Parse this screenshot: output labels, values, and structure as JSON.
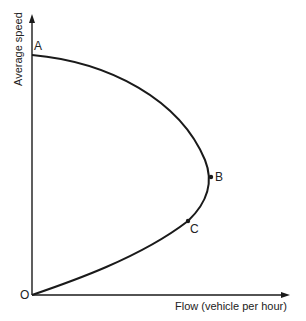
{
  "diagram": {
    "type": "speed-flow curve",
    "y_axis_label": "Average speed",
    "x_axis_label": "Flow (vehicle per hour)",
    "points": {
      "A": "A",
      "B": "B",
      "C": "C",
      "O": "O"
    },
    "line_color": "#1a1a1a"
  }
}
